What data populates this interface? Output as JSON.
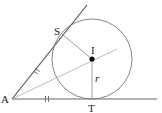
{
  "diagram": {
    "type": "geometry-incircle-tangents",
    "labels": {
      "A": "A",
      "S": "S",
      "I": "I",
      "T": "T",
      "r": "r"
    },
    "points": {
      "A": [
        12,
        99
      ],
      "S": [
        62,
        33
      ],
      "I": [
        92,
        59
      ],
      "T": [
        92,
        99
      ],
      "upper_line_end": [
        87,
        5
      ],
      "lower_line_end": [
        157,
        99
      ],
      "bisector_end": [
        117,
        49
      ]
    },
    "circle": {
      "center": [
        92,
        59
      ],
      "radius": 40
    },
    "tick_marks": {
      "AS": "||",
      "AT": "||"
    },
    "colors": {
      "tangent_line": "#555555",
      "circle": "#777777",
      "radius": "#888888",
      "bisector": "#aaaaaa",
      "center_dot": "#111111"
    }
  }
}
